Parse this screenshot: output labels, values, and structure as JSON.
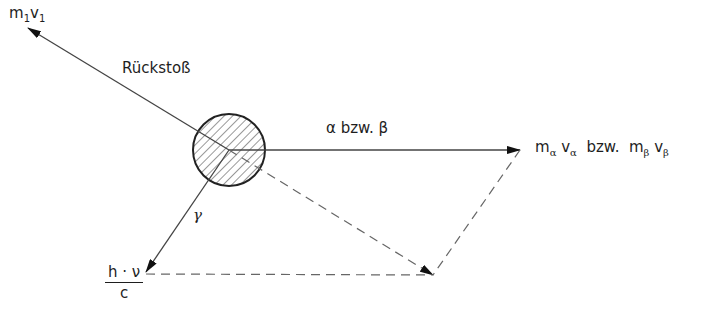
{
  "diagram": {
    "type": "momentum-vector-diagram",
    "nucleus": {
      "shape": "hatched-circle"
    },
    "labels": {
      "recoil_momentum": {
        "m": "m",
        "m_sub": "1",
        "v": "v",
        "v_sub": "1"
      },
      "recoil": "Rückstoß",
      "alpha_beta": "α bzw. β",
      "particle_momentum": {
        "m1": "m",
        "sub1": "α",
        "v1": "v",
        "vsub1": "α",
        "bzw": "bzw.",
        "m2": "m",
        "sub2": "β",
        "v2": "v",
        "vsub2": "β"
      },
      "gamma": "γ",
      "photon_momentum": {
        "numerator": "h · ν",
        "denominator": "c"
      }
    },
    "colors": {
      "line": "#2a2a2a",
      "dashed": "#555555",
      "background": "#ffffff"
    }
  }
}
